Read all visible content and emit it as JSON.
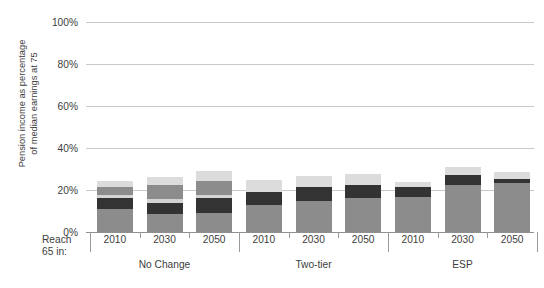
{
  "chart_data": {
    "type": "bar",
    "subtype": "stacked-bar-grouped",
    "title": "",
    "xlabel": "Reach 65 in:",
    "ylabel": "Pension income as percentage\nof median earnings at 75",
    "ylim": [
      0,
      100
    ],
    "yticks": [
      0,
      20,
      40,
      60,
      80,
      100
    ],
    "ytick_labels": [
      "0%",
      "20%",
      "40%",
      "60%",
      "80%",
      "100%"
    ],
    "grid": true,
    "legend": "none",
    "value_suffix": "%",
    "groups": [
      "No Change",
      "Two-tier",
      "ESP"
    ],
    "categories": [
      "2010",
      "2030",
      "2050"
    ],
    "series": [
      {
        "name": "segment-1",
        "color": "#8c8c8c"
      },
      {
        "name": "segment-2",
        "color": "#333333"
      },
      {
        "name": "segment-3",
        "color": "#d4d4d4"
      },
      {
        "name": "segment-4",
        "color": "#8c8c8c"
      },
      {
        "name": "segment-5",
        "color": "#dcdcdc"
      }
    ],
    "bars": [
      {
        "group": "No Change",
        "category": "2010",
        "total": 24.5,
        "values": [
          11.0,
          5.0,
          1.5,
          4.0,
          3.0
        ]
      },
      {
        "group": "No Change",
        "category": "2030",
        "total": 26.0,
        "values": [
          8.5,
          5.5,
          1.5,
          7.0,
          3.5
        ]
      },
      {
        "group": "No Change",
        "category": "2050",
        "total": 29.0,
        "values": [
          9.0,
          7.0,
          1.5,
          7.0,
          4.5
        ]
      },
      {
        "group": "Two-tier",
        "category": "2010",
        "total": 25.0,
        "values": [
          13.0,
          6.0,
          0.0,
          0.0,
          6.0
        ]
      },
      {
        "group": "Two-tier",
        "category": "2030",
        "total": 26.5,
        "values": [
          15.0,
          6.5,
          0.0,
          0.0,
          5.0
        ]
      },
      {
        "group": "Two-tier",
        "category": "2050",
        "total": 27.5,
        "values": [
          16.0,
          6.5,
          0.0,
          0.0,
          5.0
        ]
      },
      {
        "group": "ESP",
        "category": "2010",
        "total": 24.0,
        "values": [
          16.5,
          5.0,
          0.0,
          0.0,
          2.5
        ]
      },
      {
        "group": "ESP",
        "category": "2030",
        "total": 31.0,
        "values": [
          22.5,
          4.5,
          0.0,
          0.0,
          4.0
        ]
      },
      {
        "group": "ESP",
        "category": "2050",
        "total": 28.5,
        "values": [
          23.5,
          1.8,
          0.0,
          0.0,
          3.2
        ]
      }
    ]
  },
  "axis": {
    "reach_label": "Reach\n65 in:"
  },
  "colors": {
    "gridline": "#c9c9c9",
    "axis": "#8f8f8f",
    "text": "#3d3d3d",
    "background": "#ffffff"
  }
}
